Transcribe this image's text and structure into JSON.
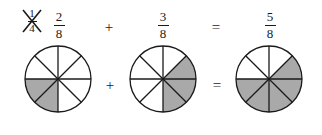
{
  "figure": {
    "kind": "fraction-addition-pie-diagram",
    "colors": {
      "shaded": "#a9a9a9",
      "stroke": "#1a1a1a",
      "unshaded": "#ffffff",
      "background": "#ffffff"
    },
    "struck_fraction": {
      "numerator": "1",
      "denominator": "4",
      "strikethrough": "x-cross"
    },
    "expression_top": {
      "term1": {
        "numerator": "2",
        "denominator": "8"
      },
      "operator1": "+",
      "term2": {
        "numerator": "3",
        "denominator": "8"
      },
      "operator2": "=",
      "result": {
        "numerator": "5",
        "denominator": "8"
      }
    },
    "expression_bottom": {
      "operator1": "+",
      "operator2": "="
    }
  },
  "chart_data": {
    "type": "pie",
    "title": "",
    "slices_total": 8,
    "charts": [
      {
        "name": "addend-1",
        "label_numerator": "2",
        "label_denominator": "8",
        "shaded_count": 2,
        "slice_shaded": [
          false,
          false,
          false,
          false,
          true,
          true,
          false,
          false
        ],
        "slice_start_degrees": [
          0,
          45,
          90,
          135,
          180,
          225,
          270,
          315
        ]
      },
      {
        "name": "addend-2",
        "label_numerator": "3",
        "label_denominator": "8",
        "shaded_count": 3,
        "slice_shaded": [
          false,
          true,
          true,
          true,
          false,
          false,
          false,
          false
        ],
        "slice_start_degrees": [
          0,
          45,
          90,
          135,
          180,
          225,
          270,
          315
        ]
      },
      {
        "name": "sum",
        "label_numerator": "5",
        "label_denominator": "8",
        "shaded_count": 5,
        "slice_shaded": [
          false,
          true,
          true,
          true,
          true,
          true,
          false,
          false
        ],
        "slice_start_degrees": [
          0,
          45,
          90,
          135,
          180,
          225,
          270,
          315
        ]
      }
    ],
    "legend": [],
    "annotations": [
      "1/4 crossed out",
      "2/8 + 3/8 = 5/8"
    ]
  }
}
